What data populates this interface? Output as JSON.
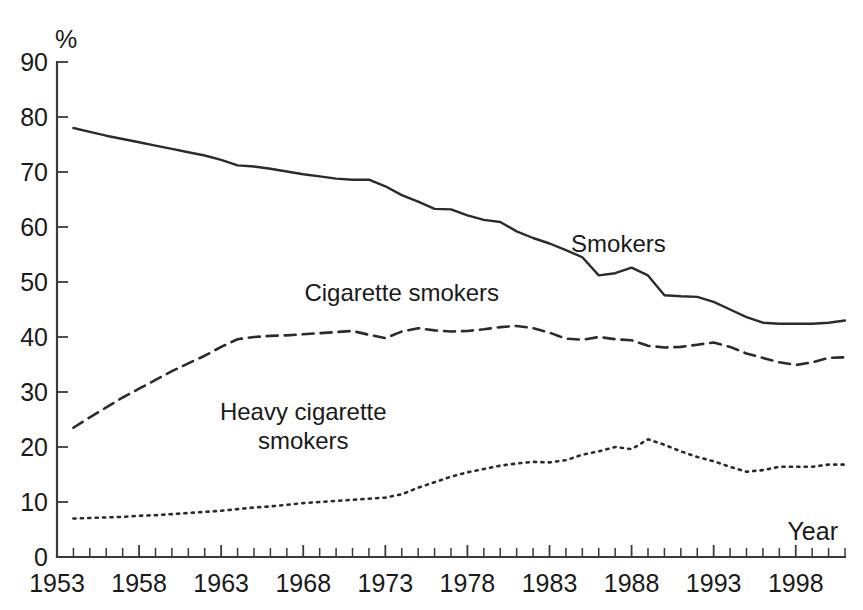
{
  "chart_data": {
    "type": "line",
    "title": "",
    "subtitle": "",
    "xlabel": "Year",
    "ylabel": "%",
    "xlim": [
      1953,
      2001
    ],
    "ylim": [
      0,
      90
    ],
    "grid": false,
    "legend_position": "inline-annotations",
    "y_ticks": [
      0,
      10,
      20,
      30,
      40,
      50,
      60,
      70,
      80,
      90
    ],
    "y_tick_labels": [
      "0",
      "10",
      "20",
      "30",
      "40",
      "50",
      "60",
      "70",
      "80",
      "90"
    ],
    "x_ticks": [
      1953,
      1958,
      1963,
      1968,
      1973,
      1978,
      1983,
      1988,
      1993,
      1998
    ],
    "x_tick_labels": [
      "1953",
      "1958",
      "1963",
      "1968",
      "1973",
      "1978",
      "1983",
      "1988",
      "1993",
      "1998"
    ],
    "x_minor_tick_interval": 1,
    "x": [
      1954,
      1955,
      1956,
      1957,
      1958,
      1959,
      1960,
      1961,
      1962,
      1963,
      1964,
      1965,
      1966,
      1967,
      1968,
      1969,
      1970,
      1971,
      1972,
      1973,
      1974,
      1975,
      1976,
      1977,
      1978,
      1979,
      1980,
      1981,
      1982,
      1983,
      1984,
      1985,
      1986,
      1987,
      1988,
      1989,
      1990,
      1991,
      1992,
      1993,
      1994,
      1995,
      1996,
      1997,
      1998,
      1999,
      2000,
      2001
    ],
    "series": [
      {
        "name": "Smokers",
        "style": "solid",
        "color": "#2b2b2b",
        "label_x": 1987.2,
        "label_y": 55.5,
        "values": [
          78.0,
          77.3,
          76.6,
          76.0,
          75.4,
          74.8,
          74.2,
          73.6,
          73.0,
          72.2,
          71.2,
          71.0,
          70.6,
          70.1,
          69.6,
          69.2,
          68.8,
          68.6,
          68.6,
          67.4,
          65.8,
          64.6,
          63.3,
          63.2,
          62.1,
          61.3,
          60.9,
          59.2,
          58.0,
          57.0,
          55.8,
          54.5,
          51.2,
          51.6,
          52.6,
          51.2,
          47.6,
          47.4,
          47.3,
          46.4,
          45.0,
          43.6,
          42.6,
          42.4,
          42.4,
          42.4,
          42.6,
          43.0
        ]
      },
      {
        "name": "Cigarette smokers",
        "style": "dashed",
        "color": "#2b2b2b",
        "label_x": 1974.0,
        "label_y": 46.5,
        "values": [
          23.5,
          25.4,
          27.2,
          29.0,
          30.6,
          32.2,
          33.8,
          35.2,
          36.6,
          38.2,
          39.6,
          40.0,
          40.2,
          40.3,
          40.5,
          40.7,
          40.9,
          41.1,
          40.4,
          39.8,
          41.0,
          41.6,
          41.2,
          41.0,
          41.1,
          41.4,
          41.8,
          42.0,
          41.6,
          40.8,
          39.7,
          39.5,
          40.0,
          39.6,
          39.4,
          38.4,
          38.1,
          38.2,
          38.6,
          39.0,
          38.2,
          37.0,
          36.2,
          35.4,
          34.9,
          35.4,
          36.2,
          36.3
        ]
      },
      {
        "name": "Heavy cigarette smokers",
        "style": "dotted",
        "color": "#2b2b2b",
        "label_x": 1968.0,
        "label_y": 25.0,
        "values": [
          7.0,
          7.1,
          7.2,
          7.3,
          7.5,
          7.6,
          7.8,
          8.0,
          8.2,
          8.4,
          8.7,
          9.0,
          9.2,
          9.5,
          9.8,
          10.0,
          10.2,
          10.4,
          10.6,
          10.8,
          11.4,
          12.6,
          13.6,
          14.6,
          15.4,
          16.0,
          16.6,
          17.0,
          17.3,
          17.2,
          17.6,
          18.6,
          19.2,
          20.0,
          19.6,
          21.4,
          20.4,
          19.2,
          18.2,
          17.4,
          16.4,
          15.5,
          15.8,
          16.4,
          16.4,
          16.4,
          16.8,
          16.8
        ]
      }
    ],
    "annotations": [
      {
        "text": "Smokers",
        "lines": [
          "Smokers"
        ]
      },
      {
        "text": "Cigarette smokers",
        "lines": [
          "Cigarette smokers"
        ]
      },
      {
        "text": "Heavy cigarette smokers",
        "lines": [
          "Heavy cigarette",
          "smokers"
        ]
      }
    ]
  },
  "axes": {
    "y_axis_title": "%",
    "x_axis_title": "Year"
  }
}
